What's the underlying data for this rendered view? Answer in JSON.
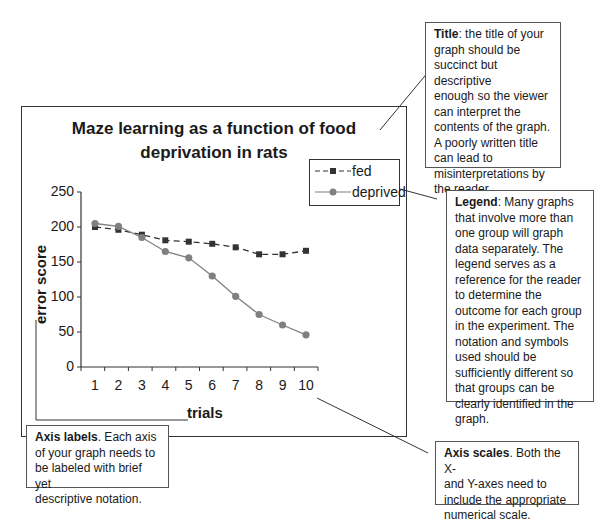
{
  "chart_data": {
    "type": "line",
    "title": "Maze learning as a function of food deprivation in rats",
    "title_lines": [
      "Maze learning as a function of food",
      "deprivation in rats"
    ],
    "xlabel": "trials",
    "ylabel": "error score",
    "x": [
      1,
      2,
      3,
      4,
      5,
      6,
      7,
      8,
      9,
      10
    ],
    "ylim": [
      0,
      250
    ],
    "yticks": [
      0,
      50,
      100,
      150,
      200,
      250
    ],
    "grid": false,
    "legend_position": "top-right",
    "series": [
      {
        "name": "fed",
        "style": "dashed",
        "marker": "square",
        "color": "#333333",
        "values": [
          200,
          196,
          189,
          181,
          179,
          176,
          171,
          161,
          161,
          166
        ]
      },
      {
        "name": "deprived",
        "style": "solid",
        "marker": "circle",
        "color": "#808080",
        "values": [
          205,
          201,
          185,
          165,
          156,
          130,
          101,
          75,
          60,
          46
        ]
      }
    ]
  },
  "annotations": {
    "title_note": {
      "heading": "Title",
      "sep": ": ",
      "lines": [
        "the title of your",
        "graph should be",
        "succinct but descriptive",
        "enough so the viewer",
        "can interpret the",
        "contents of the graph.",
        "A poorly written title",
        "can lead to",
        "misinterpretations by",
        "the reader."
      ]
    },
    "legend_note": {
      "heading": "Legend",
      "sep": ": ",
      "lines": [
        "Many graphs",
        "that involve more than",
        "one group will graph",
        "data separately. The",
        "legend serves as a",
        "reference for the reader",
        "to determine the",
        "outcome for each group",
        "in the experiment. The",
        "notation and symbols",
        "used should be",
        "sufficiently different so",
        "that groups can be",
        "clearly identified in the",
        "graph."
      ]
    },
    "axis_labels_note": {
      "heading": "Axis labels",
      "sep": ". ",
      "lines": [
        "Each axis",
        "of your graph needs to",
        "be labeled with brief yet",
        "descriptive notation."
      ]
    },
    "axis_scales_note": {
      "heading": "Axis scales",
      "sep": ". ",
      "lines": [
        "Both the X-",
        "and Y-axes need to",
        "include the appropriate",
        "numerical scale."
      ]
    }
  }
}
